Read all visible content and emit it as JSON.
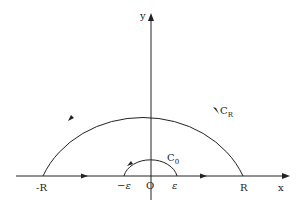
{
  "diagram": {
    "axes": {
      "x_label": "x",
      "y_label": "y",
      "origin_label": "O"
    },
    "points": {
      "neg_R": "-R",
      "R": "R",
      "neg_eps": "−ε",
      "eps": "ε"
    },
    "contours": {
      "large": "C",
      "large_sub": "R",
      "small": "C",
      "small_sub": "0"
    },
    "colors": {
      "stroke": "#222222",
      "background": "#ffffff"
    }
  }
}
